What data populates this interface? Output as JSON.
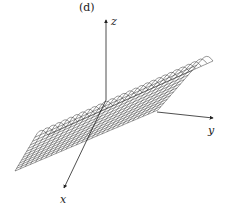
{
  "figure": {
    "panel_label": "(d)",
    "axes": {
      "x_label": "x",
      "y_label": "y",
      "z_label": "z"
    },
    "surface": {
      "style": "wireframe mesh",
      "shape": "ridge along y-axis, curved crest falling off on x side",
      "line_color": "#333333",
      "u_lines": 28,
      "v_lines": 12
    }
  }
}
